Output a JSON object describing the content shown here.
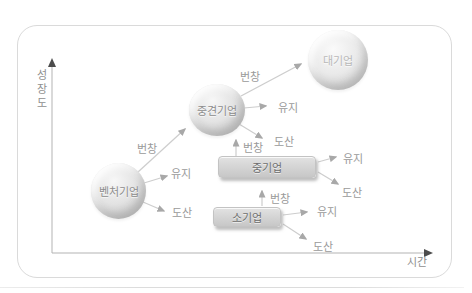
{
  "figure": {
    "type": "company-growth-stage-diagram",
    "axes": {
      "y_label": "성장도",
      "x_label": "시간"
    },
    "nodes": {
      "venture": {
        "label": "벤처기업",
        "shape": "circle"
      },
      "midsize": {
        "label": "중견기업",
        "shape": "circle"
      },
      "large": {
        "label": "대기업",
        "shape": "circle"
      },
      "medium": {
        "label": "중기업",
        "shape": "rect"
      },
      "small": {
        "label": "소기업",
        "shape": "rect"
      }
    },
    "edge_labels": {
      "prosper": "번창",
      "maintain": "유지",
      "bankrupt": "도산"
    },
    "edges": [
      {
        "from": "벤처기업",
        "label": "번창",
        "to": "중견기업"
      },
      {
        "from": "벤처기업",
        "label": "유지"
      },
      {
        "from": "벤처기업",
        "label": "도산"
      },
      {
        "from": "중견기업",
        "label": "번창",
        "to": "대기업"
      },
      {
        "from": "중견기업",
        "label": "유지"
      },
      {
        "from": "중견기업",
        "label": "도산"
      },
      {
        "from": "중기업",
        "label": "번창",
        "to": "중견기업"
      },
      {
        "from": "중기업",
        "label": "유지"
      },
      {
        "from": "중기업",
        "label": "도산"
      },
      {
        "from": "소기업",
        "label": "번창",
        "to": "중기업"
      },
      {
        "from": "소기업",
        "label": "유지"
      },
      {
        "from": "소기업",
        "label": "도산"
      }
    ],
    "colors": {
      "node_fill": "#d9d9d9",
      "arrow": "#cdcdcd",
      "arrowhead": "#a8a8a8",
      "axis": "#b3b3b3",
      "axis_arrowhead": "#4c4c4c",
      "label_text": "#9a9a9a",
      "frame_border": "#dadada"
    }
  }
}
